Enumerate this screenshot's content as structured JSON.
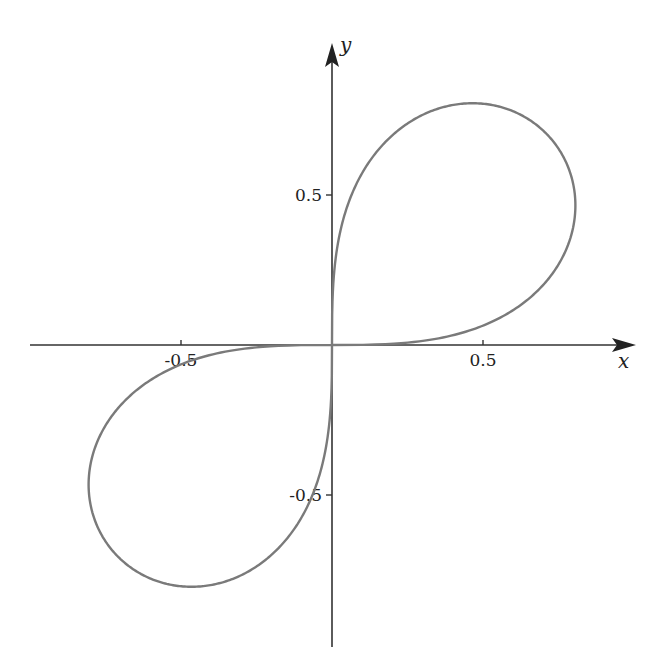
{
  "chart_data": {
    "type": "line",
    "title": "",
    "curve": "lemniscate r^2 = sin(2θ) (lobes in quadrants I and III)",
    "xlabel": "x",
    "ylabel": "y",
    "xlim": [
      -1.0,
      1.0
    ],
    "ylim": [
      -1.0,
      1.0
    ],
    "x_ticks": [
      {
        "value": -0.5,
        "label": "-0.5"
      },
      {
        "value": 0.5,
        "label": "0.5"
      }
    ],
    "y_ticks": [
      {
        "value": 0.5,
        "label": "0.5"
      },
      {
        "value": -0.5,
        "label": "-0.5"
      }
    ],
    "grid": false,
    "legend": null,
    "series": [
      {
        "name": "curve",
        "color": "#7a7a7a",
        "key_points": [
          {
            "x": 0.0,
            "y": 0.0
          },
          {
            "x": 0.805,
            "y": 0.46
          },
          {
            "x": 0.705,
            "y": 0.705
          },
          {
            "x": 0.467,
            "y": 0.81
          },
          {
            "x": -0.805,
            "y": -0.46
          },
          {
            "x": -0.705,
            "y": -0.705
          },
          {
            "x": -0.467,
            "y": -0.81
          }
        ]
      }
    ]
  },
  "axes": {
    "color": "#333333",
    "x_label": "x",
    "y_label": "y"
  },
  "layout": {
    "origin_px": [
      332,
      345
    ],
    "scale_x": 302,
    "scale_y": 300
  }
}
